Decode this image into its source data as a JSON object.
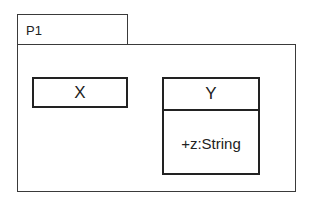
{
  "package": {
    "name": "P1",
    "classes": [
      {
        "name": "X",
        "attributes": []
      },
      {
        "name": "Y",
        "attributes": [
          "+z:String"
        ]
      }
    ]
  }
}
